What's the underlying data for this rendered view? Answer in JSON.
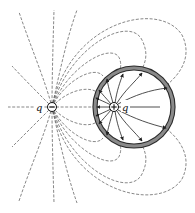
{
  "figure": {
    "background": "#ffffff"
  },
  "charges": {
    "negative": {
      "label": "q",
      "sign": "−",
      "cx": 52,
      "cy": 107,
      "r": 4.5
    },
    "positive": {
      "label": "q",
      "sign": "+",
      "cx": 114,
      "cy": 107,
      "r": 4.5
    }
  },
  "shell": {
    "cx": 134,
    "cy": 107,
    "outer_r": 41,
    "thickness": 4,
    "fill_color": "#8a8a8a",
    "edge_color": "#2b2b2b"
  },
  "field_lines": {
    "outer_style": "dashed",
    "inner_style": "solid-with-arrows",
    "line_color": "#555555",
    "arrow_color": "#222222"
  }
}
